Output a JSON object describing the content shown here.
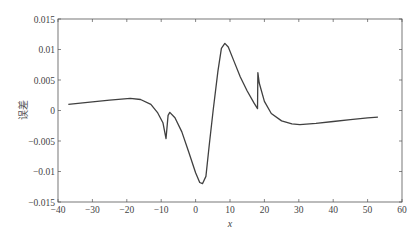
{
  "chart_data": {
    "type": "line",
    "title": "",
    "xlabel": "x",
    "ylabel": "误差",
    "xlim": [
      -40,
      60
    ],
    "ylim": [
      -0.015,
      0.015
    ],
    "grid": false,
    "legend": null,
    "x_ticks": [
      -40,
      -30,
      -20,
      -10,
      0,
      10,
      20,
      30,
      40,
      50,
      60
    ],
    "x_tick_labels": [
      "-40",
      "-30",
      "-20",
      "-10",
      "0",
      "10",
      "20",
      "30",
      "40",
      "50",
      "60"
    ],
    "y_ticks": [
      -0.015,
      -0.01,
      -0.005,
      0,
      0.005,
      0.01,
      0.015
    ],
    "y_tick_labels": [
      "-0.015",
      "-0.01",
      "-0.005",
      "0",
      "0.005",
      "0.01",
      "0.015"
    ],
    "series": [
      {
        "name": "误差",
        "color": "#404040",
        "x": [
          -37,
          -30,
          -25,
          -19,
          -16,
          -13,
          -11,
          -9.5,
          -8.6,
          -8.0,
          -7.5,
          -6,
          -4,
          -2,
          0,
          1.2,
          2,
          3,
          4,
          5.1,
          6.5,
          7.5,
          8.5,
          9.5,
          11,
          13,
          15,
          17,
          18.0,
          18.1,
          18.5,
          20,
          22,
          25,
          28,
          30.3,
          35,
          40,
          45,
          50,
          53
        ],
        "y": [
          0.001,
          0.0014,
          0.0017,
          0.002,
          0.0018,
          0.001,
          -0.0004,
          -0.002,
          -0.0046,
          -0.0008,
          -0.0003,
          -0.0012,
          -0.0035,
          -0.0068,
          -0.0102,
          -0.0118,
          -0.012,
          -0.0108,
          -0.0055,
          0.0,
          0.0065,
          0.0102,
          0.011,
          0.0104,
          0.0083,
          0.0055,
          0.0032,
          0.0012,
          0.0003,
          0.0062,
          0.0045,
          0.0015,
          -0.0005,
          -0.0017,
          -0.0022,
          -0.0023,
          -0.0021,
          -0.0018,
          -0.0015,
          -0.0012,
          -0.0011
        ]
      }
    ]
  },
  "caption_fragment": ""
}
